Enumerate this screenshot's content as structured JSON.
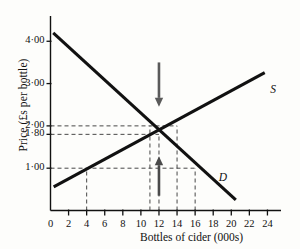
{
  "chart_data": {
    "type": "line",
    "title": "",
    "xlabel": "Bottles of cider (000s)",
    "ylabel": "Price (£s per bottle)",
    "xlim": [
      0,
      25.5
    ],
    "ylim": [
      0,
      4.55
    ],
    "grid": false,
    "legend_position": "inline-curve-labels",
    "x_ticks": [
      "0",
      "2",
      "4",
      "6",
      "8",
      "10",
      "12",
      "14",
      "16",
      "18",
      "20",
      "22",
      "24"
    ],
    "x_tick_values": [
      0,
      2,
      4,
      6,
      8,
      10,
      12,
      14,
      16,
      18,
      20,
      22,
      24
    ],
    "y_ticks": [
      "4·00",
      "3·00",
      "2·00",
      "1·80",
      "1·00"
    ],
    "y_tick_values": [
      4.0,
      3.0,
      2.0,
      1.8,
      1.0
    ],
    "series": [
      {
        "name": "D",
        "label": "D",
        "label_x": 18.6,
        "label_y": 0.74,
        "points": [
          [
            0.3,
            4.2
          ],
          [
            20.5,
            0.25
          ]
        ]
      },
      {
        "name": "S",
        "label": "S",
        "label_x": 24.3,
        "label_y": 2.82,
        "points": [
          [
            0.35,
            0.56
          ],
          [
            23.7,
            3.26
          ]
        ]
      }
    ],
    "equilibrium": {
      "x": 12,
      "y": 1.8
    },
    "guide_lines": [
      {
        "type": "horizontal",
        "y": 2.0,
        "from_x": 0,
        "to_x": 14.0
      },
      {
        "type": "horizontal",
        "y": 1.8,
        "from_x": 0,
        "to_x": 12.0
      },
      {
        "type": "horizontal",
        "y": 1.0,
        "from_x": 0,
        "to_x": 16.0
      },
      {
        "type": "vertical",
        "x": 4.0,
        "from_y": 0,
        "to_y": 1.0
      },
      {
        "type": "vertical",
        "x": 11.0,
        "from_y": 0,
        "to_y": 2.0
      },
      {
        "type": "vertical",
        "x": 12.0,
        "from_y": 0,
        "to_y": 1.8
      },
      {
        "type": "vertical",
        "x": 14.0,
        "from_y": 0,
        "to_y": 2.0
      },
      {
        "type": "vertical",
        "x": 16.0,
        "from_y": 0,
        "to_y": 1.0
      }
    ],
    "annotations": [
      {
        "name": "down-arrow",
        "direction": "down",
        "x": 12.0,
        "from_y": 3.5,
        "to_y": 2.45,
        "color": "#5a5a5a"
      },
      {
        "name": "up-arrow",
        "direction": "up",
        "x": 12.0,
        "from_y": 0.35,
        "to_y": 1.28,
        "color": "#4a4a4a"
      }
    ],
    "colors": {
      "curve": "#111111",
      "guide": "#333333",
      "axis": "#111111",
      "down_arrow": "#5a5a5a",
      "up_arrow": "#4a4a4a",
      "background": "#fdfdfb"
    }
  }
}
